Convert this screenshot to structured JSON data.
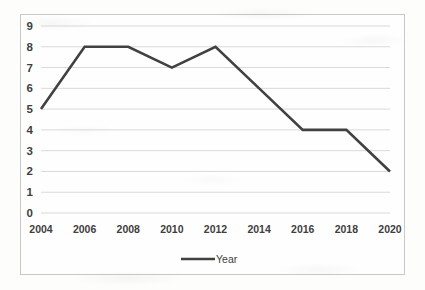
{
  "chart_data": {
    "type": "line",
    "title": "",
    "xlabel": "",
    "ylabel": "",
    "categories": [
      "2004",
      "2006",
      "2008",
      "2010",
      "2012",
      "2014",
      "2016",
      "2018",
      "2020"
    ],
    "x": [
      2004,
      2006,
      2008,
      2010,
      2012,
      2014,
      2016,
      2018,
      2020
    ],
    "series": [
      {
        "name": "Year",
        "values": [
          5,
          8,
          8,
          7,
          8,
          6,
          4,
          4,
          2
        ],
        "color": "#414141"
      }
    ],
    "ylim": [
      0,
      9
    ],
    "xlim": [
      2004,
      2020
    ],
    "ytick_labels": [
      "0",
      "1",
      "2",
      "3",
      "4",
      "5",
      "6",
      "7",
      "8",
      "9"
    ],
    "ytick_values": [
      0,
      1,
      2,
      3,
      4,
      5,
      6,
      7,
      8,
      9
    ],
    "xtick_labels": [
      "2004",
      "2006",
      "2008",
      "2010",
      "2012",
      "2014",
      "2016",
      "2018",
      "2020"
    ],
    "grid": "horizontal",
    "legend_position": "bottom",
    "legend_entries": [
      "Year"
    ],
    "colors": {
      "line": "#414141",
      "gridline": "#d9d9d9",
      "border": "#c8c8c6",
      "text": "#3f3f3f",
      "background": "#fefefe"
    }
  }
}
